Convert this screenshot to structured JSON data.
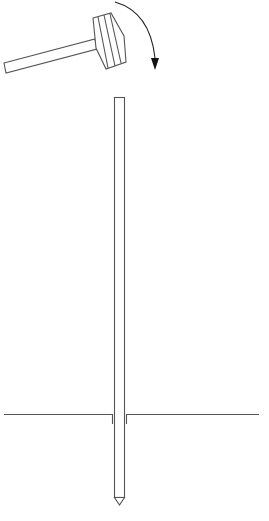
{
  "diagram": {
    "colors": {
      "background": "#ffffff",
      "line": "#555555",
      "arrow": "#222222"
    },
    "elements": [
      {
        "name": "hammer",
        "parts": [
          "handle",
          "head"
        ]
      },
      {
        "name": "swing-arrow",
        "direction": "clockwise-down"
      },
      {
        "name": "stake",
        "top_y": 97,
        "tip_y": 505,
        "x_left": 114,
        "x_right": 125
      },
      {
        "name": "ground-line",
        "y": 414,
        "x_start": 4,
        "x_end": 259
      }
    ],
    "labels": []
  }
}
